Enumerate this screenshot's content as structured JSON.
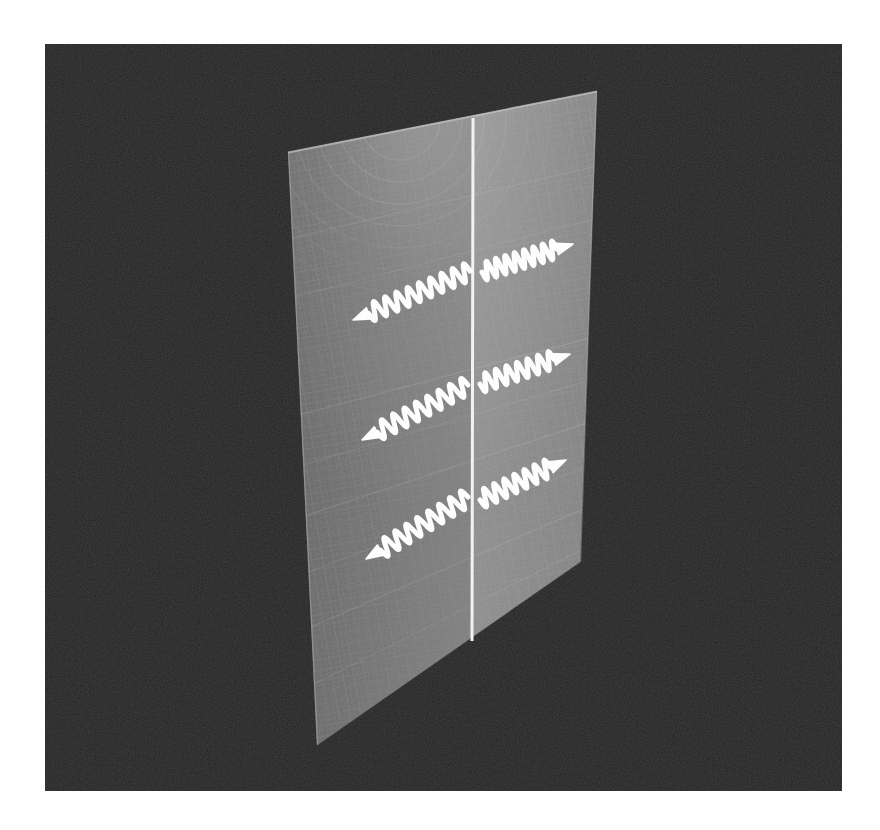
{
  "figure": {
    "background_color": "#ffffff",
    "plate": {
      "name": "photographic-plate",
      "left": 45,
      "top": 44,
      "width": 797,
      "height": 747,
      "fill_color": "#232323",
      "grain": true
    },
    "plane": {
      "name": "textured-plane",
      "description": "grey woven-grid / graph-paper textured sheet seen in oblique perspective",
      "base_color": "#7f7f7f",
      "shade_left": "#6e6e6e",
      "shade_right": "#8a8a8a",
      "corners": {
        "top_left": [
          288,
          152
        ],
        "top_right": [
          597,
          91
        ],
        "bottom_right": [
          580,
          562
        ],
        "bottom_left": [
          317,
          745
        ]
      },
      "grid_spacing_px": 11,
      "grid_line_color": "#919191",
      "arc_highlight": true
    },
    "midline": {
      "name": "vertical-midline",
      "color": "#f2f2f2",
      "width_px": 3,
      "start": [
        473,
        118
      ],
      "end": [
        472,
        641
      ]
    },
    "waves": [
      {
        "id": "wave-row-1-left",
        "row": 1,
        "direction": "left",
        "arrow_color": "#fdfdfd",
        "start": [
          470,
          271
        ],
        "end": [
          353,
          320
        ],
        "cycles": 9,
        "amplitude_px": 9,
        "stroke_px": 5
      },
      {
        "id": "wave-row-1-right",
        "row": 1,
        "direction": "right",
        "arrow_color": "#fdfdfd",
        "start": [
          482,
          272
        ],
        "end": [
          573,
          244
        ],
        "cycles": 8,
        "amplitude_px": 9,
        "stroke_px": 5
      },
      {
        "id": "wave-row-2-left",
        "row": 2,
        "direction": "left",
        "arrow_color": "#fdfdfd",
        "start": [
          468,
          385
        ],
        "end": [
          362,
          440
        ],
        "cycles": 8,
        "amplitude_px": 9,
        "stroke_px": 5
      },
      {
        "id": "wave-row-2-right",
        "row": 2,
        "direction": "right",
        "arrow_color": "#fdfdfd",
        "start": [
          480,
          384
        ],
        "end": [
          570,
          354
        ],
        "cycles": 7,
        "amplitude_px": 9,
        "stroke_px": 5
      },
      {
        "id": "wave-row-3-left",
        "row": 3,
        "direction": "left",
        "arrow_color": "#fdfdfd",
        "start": [
          468,
          497
        ],
        "end": [
          366,
          559
        ],
        "cycles": 8,
        "amplitude_px": 9,
        "stroke_px": 5
      },
      {
        "id": "wave-row-3-right",
        "row": 3,
        "direction": "right",
        "arrow_color": "#fdfdfd",
        "start": [
          480,
          500
        ],
        "end": [
          566,
          460
        ],
        "cycles": 7,
        "amplitude_px": 9,
        "stroke_px": 5
      }
    ],
    "labels": {
      "none_visible": "This figure contains no visible text, axis ticks, legend or annotation labels."
    }
  }
}
